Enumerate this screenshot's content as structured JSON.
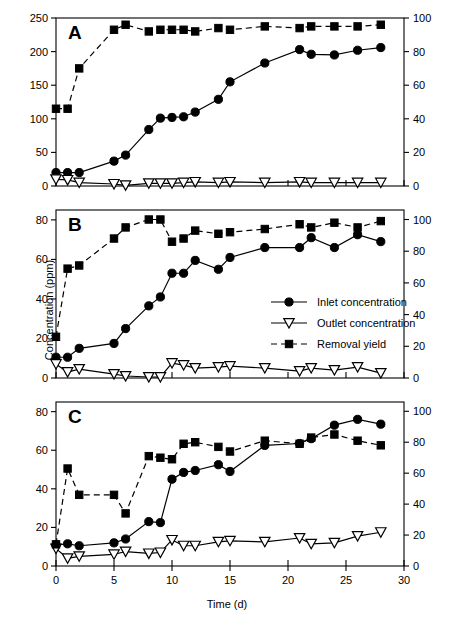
{
  "figure": {
    "xlabel": "Time (d)",
    "ylabel_left": "Concentration (ppm)",
    "ylabel_right": "Removal yield (%)",
    "panel_letters": [
      "A",
      "B",
      "C"
    ]
  },
  "legend": {
    "position": "middle-right (panel B)",
    "items": [
      {
        "label": "Inlet concentration",
        "marker": "filled-circle",
        "line": "solid"
      },
      {
        "label": "Outlet concentration",
        "marker": "open-triangle-down",
        "line": "solid"
      },
      {
        "label": "Removal yield",
        "marker": "filled-square",
        "line": "dashed"
      }
    ]
  },
  "colors": {
    "line": "#000000",
    "marker_fill": "#000000",
    "open_marker_fill": "#ffffff",
    "axis": "#000000",
    "background": "#ffffff"
  },
  "chart_data": [
    {
      "type": "line",
      "panel": "A",
      "title": "A",
      "xlabel": "Time (d)",
      "ylabel": "Concentration (ppm)",
      "ylabel_right": "Removal yield (%)",
      "xlim": [
        0,
        30
      ],
      "ylim": [
        0,
        250
      ],
      "ylim_right": [
        0,
        100
      ],
      "xticks": [
        0,
        5,
        10,
        15,
        20,
        25,
        30
      ],
      "yticks": [
        0,
        50,
        100,
        150,
        200,
        250
      ],
      "yticks_right": [
        0,
        20,
        40,
        60,
        80,
        100
      ],
      "grid": false,
      "series": [
        {
          "name": "Inlet concentration",
          "axis": "left",
          "marker": "filled-circle",
          "line": "solid",
          "x": [
            0,
            1,
            2,
            5,
            6,
            8,
            9,
            10,
            11,
            12,
            14,
            15,
            18,
            21,
            22,
            24,
            26,
            28
          ],
          "y": [
            20,
            20,
            20,
            37,
            46,
            84,
            101,
            102,
            103,
            110,
            129,
            155,
            183,
            203,
            196,
            195,
            202,
            206
          ]
        },
        {
          "name": "Outlet concentration",
          "axis": "left",
          "marker": "open-triangle-down",
          "line": "solid",
          "x": [
            0,
            1,
            2,
            5,
            6,
            8,
            9,
            10,
            11,
            12,
            14,
            15,
            18,
            21,
            22,
            24,
            26,
            28
          ],
          "y": [
            10,
            9,
            5,
            3,
            1,
            4,
            4,
            4,
            5,
            6,
            5,
            6,
            5,
            6,
            5,
            5,
            5,
            5
          ]
        },
        {
          "name": "Removal yield",
          "axis": "right",
          "marker": "filled-square",
          "line": "dashed",
          "x": [
            0,
            1,
            2,
            5,
            6,
            8,
            9,
            10,
            11,
            12,
            14,
            15,
            18,
            21,
            22,
            24,
            26,
            28
          ],
          "y": [
            46,
            46,
            70,
            93,
            96,
            92,
            93,
            93,
            93,
            92,
            94,
            93,
            95,
            94,
            95,
            95,
            95,
            96
          ]
        }
      ]
    },
    {
      "type": "line",
      "panel": "B",
      "title": "B",
      "xlabel": "Time (d)",
      "ylabel": "Concentration (ppm)",
      "ylabel_right": "Removal yield (%)",
      "xlim": [
        0,
        30
      ],
      "ylim": [
        0,
        85
      ],
      "ylim_right": [
        0,
        106
      ],
      "xticks": [
        0,
        5,
        10,
        15,
        20,
        25,
        30
      ],
      "yticks": [
        0,
        20,
        40,
        60,
        80
      ],
      "yticks_right": [
        0,
        20,
        40,
        60,
        80,
        100
      ],
      "grid": false,
      "series": [
        {
          "name": "Inlet concentration",
          "axis": "left",
          "marker": "filled-circle",
          "line": "solid",
          "x": [
            0,
            1,
            2,
            5,
            6,
            8,
            9,
            10,
            11,
            12,
            14,
            15,
            18,
            21,
            22,
            24,
            26,
            28
          ],
          "y": [
            10.5,
            10.5,
            15,
            17.5,
            25,
            36.5,
            41,
            53,
            53,
            59.5,
            55,
            61,
            66,
            66,
            71,
            66,
            72.5,
            69
          ]
        },
        {
          "name": "Outlet concentration",
          "axis": "left",
          "marker": "open-triangle-down",
          "line": "solid",
          "x": [
            0,
            1,
            2,
            5,
            6,
            8,
            9,
            10,
            11,
            12,
            14,
            15,
            18,
            21,
            22,
            24,
            26,
            28
          ],
          "y": [
            7,
            3,
            4.5,
            2,
            1,
            0.5,
            0.5,
            7.5,
            6.5,
            5,
            5.5,
            6,
            5,
            3.5,
            5,
            4,
            5.5,
            2.5
          ]
        },
        {
          "name": "Removal yield",
          "axis": "right",
          "marker": "filled-square",
          "line": "dashed",
          "x": [
            0,
            1,
            2,
            5,
            6,
            8,
            9,
            10,
            11,
            12,
            14,
            15,
            18,
            21,
            22,
            24,
            26,
            28
          ],
          "y": [
            26,
            69,
            71,
            88,
            95,
            100,
            100,
            86,
            88,
            93,
            91,
            92,
            94,
            97,
            95,
            98,
            95,
            99
          ]
        }
      ]
    },
    {
      "type": "line",
      "panel": "C",
      "title": "C",
      "xlabel": "Time (d)",
      "ylabel": "Concentration (ppm)",
      "ylabel_right": "Removal yield (%)",
      "xlim": [
        0,
        30
      ],
      "ylim": [
        0,
        85
      ],
      "ylim_right": [
        0,
        106
      ],
      "xticks": [
        0,
        5,
        10,
        15,
        20,
        25,
        30
      ],
      "yticks": [
        0,
        20,
        40,
        60,
        80
      ],
      "yticks_right": [
        0,
        20,
        40,
        60,
        80,
        100
      ],
      "grid": false,
      "series": [
        {
          "name": "Inlet concentration",
          "axis": "left",
          "marker": "filled-circle",
          "line": "solid",
          "x": [
            0,
            1,
            2,
            5,
            6,
            8,
            9,
            10,
            11,
            12,
            14,
            15,
            18,
            21,
            22,
            24,
            26,
            28
          ],
          "y": [
            11,
            11.5,
            10.5,
            12,
            14,
            23,
            22.5,
            45,
            48.5,
            49.5,
            52.5,
            49,
            62.5,
            63.5,
            66,
            73,
            76,
            73.5
          ]
        },
        {
          "name": "Outlet concentration",
          "axis": "left",
          "marker": "open-triangle-down",
          "line": "solid",
          "x": [
            0,
            1,
            2,
            5,
            6,
            8,
            9,
            10,
            11,
            12,
            14,
            15,
            18,
            21,
            22,
            24,
            26,
            28
          ],
          "y": [
            9,
            4,
            5,
            6,
            7.5,
            6.5,
            7,
            13.5,
            10.5,
            10.5,
            12.5,
            13,
            12.5,
            14.5,
            11.5,
            12,
            15.5,
            17.5
          ]
        },
        {
          "name": "Removal yield",
          "axis": "right",
          "marker": "filled-square",
          "line": "dashed",
          "x": [
            0,
            1,
            2,
            5,
            6,
            8,
            9,
            10,
            11,
            12,
            14,
            15,
            18,
            21,
            22,
            24,
            26,
            28
          ],
          "y": [
            14,
            63,
            46,
            46,
            34,
            71,
            70,
            69,
            79,
            80,
            77,
            74,
            81,
            79,
            83,
            85,
            81,
            78
          ]
        }
      ]
    }
  ]
}
